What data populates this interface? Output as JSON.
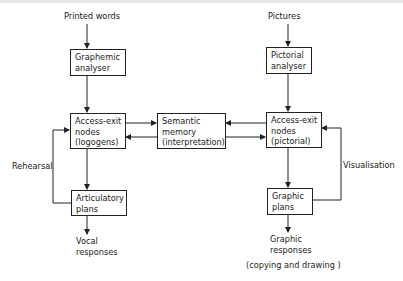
{
  "diagram": {
    "inputs": {
      "left": "Printed words",
      "right": "Pictures"
    },
    "boxes": {
      "graphemic_analyser": "Graphemic\nanalyser",
      "access_exit_logogens": "Access-exit\nnodes\n(logogens)",
      "articulatory_plans": "Articulatory\nplans",
      "semantic_memory": "Semantic\nmemory\n(interpretation)",
      "pictorial_analyser": "Pictorial\nanalyser",
      "access_exit_pictorial": "Access-exit\nnodes\n(pictorial)",
      "graphic_plans": "Graphic\nplans"
    },
    "loops": {
      "left": "Rehearsal",
      "right": "Visualisation"
    },
    "outputs": {
      "left": "Vocal\nresponses",
      "right": "Graphic\nresponses",
      "right_note": "(copying and drawing )"
    },
    "colors": {
      "line": "#222222",
      "background": "#ffffff"
    }
  }
}
